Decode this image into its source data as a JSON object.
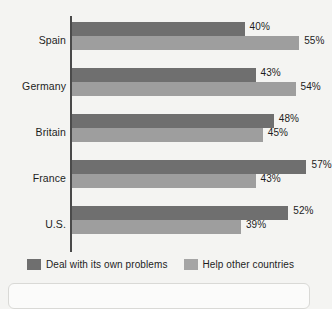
{
  "chart_data": {
    "type": "bar",
    "orientation": "horizontal",
    "title": "",
    "xlabel": "",
    "ylabel": "",
    "grid": false,
    "legend_position": "bottom",
    "xlim": [
      0,
      60
    ],
    "categories": [
      "Spain",
      "Germany",
      "Britain",
      "France",
      "U.S."
    ],
    "series": [
      {
        "name": "Deal with its own problems",
        "color": "#6f6f6f",
        "values": [
          40,
          43,
          48,
          57,
          52
        ],
        "value_labels": [
          "40%",
          "43%",
          "48%",
          "57%",
          "52%"
        ]
      },
      {
        "name": "Help other countries",
        "color": "#9e9e9e",
        "values": [
          55,
          54,
          45,
          43,
          39
        ],
        "value_labels": [
          "55%",
          "54%",
          "45%",
          "43%",
          "39%"
        ]
      }
    ]
  },
  "legend": {
    "items": [
      {
        "label": "Deal with its own problems",
        "swatch": "dark"
      },
      {
        "label": "Help other countries",
        "swatch": "light"
      }
    ]
  }
}
